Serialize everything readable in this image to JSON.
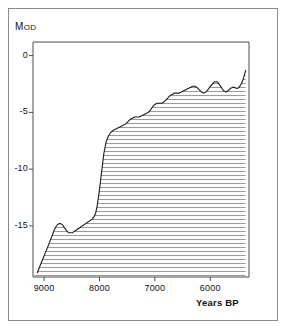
{
  "figure": {
    "background_color": "#ffffff",
    "frame_color": "#8a8a8a",
    "axis_color": "#4a4a4a",
    "curve_color": "#1a1a1a",
    "hatch_color": "#9a9a9a"
  },
  "chart_data": {
    "type": "area",
    "title": "",
    "subtitle": "",
    "xlabel": "Years BP",
    "ylabel": "M OD",
    "ylabel_main": "M",
    "ylabel_small": "OD",
    "xlim": [
      9200,
      5300
    ],
    "ylim": [
      -19.5,
      1.2
    ],
    "x_reversed": true,
    "grid": false,
    "legend": null,
    "annotations": [],
    "x_ticks": [
      9000,
      8000,
      7000,
      6000
    ],
    "x_tick_labels": [
      "9000",
      "8000",
      "7000",
      "6000"
    ],
    "y_ticks": [
      0,
      -5,
      -10,
      -15
    ],
    "y_tick_labels": [
      "0",
      "-5",
      "-10",
      "-15"
    ],
    "fill_style": "horizontal-hatch",
    "fill_direction": "below-curve-to-left-axis",
    "series": [
      {
        "name": "Relative sea level",
        "x": [
          9120,
          9080,
          9030,
          8980,
          8930,
          8890,
          8850,
          8820,
          8790,
          8760,
          8730,
          8700,
          8670,
          8640,
          8610,
          8580,
          8550,
          8520,
          8490,
          8460,
          8430,
          8400,
          8370,
          8340,
          8310,
          8280,
          8250,
          8220,
          8190,
          8160,
          8130,
          8100,
          8070,
          8040,
          8010,
          7980,
          7950,
          7920,
          7880,
          7840,
          7800,
          7760,
          7720,
          7680,
          7640,
          7600,
          7560,
          7520,
          7480,
          7440,
          7400,
          7360,
          7320,
          7280,
          7240,
          7200,
          7160,
          7120,
          7080,
          7040,
          7000,
          6960,
          6920,
          6880,
          6840,
          6800,
          6760,
          6720,
          6680,
          6640,
          6600,
          6560,
          6520,
          6480,
          6440,
          6400,
          6360,
          6320,
          6280,
          6240,
          6200,
          6160,
          6120,
          6080,
          6040,
          6000,
          5960,
          5920,
          5880,
          5840,
          5800,
          5760,
          5720,
          5680,
          5640,
          5600,
          5560,
          5520,
          5480,
          5440,
          5400,
          5360
        ],
        "y": [
          -19.1,
          -18.6,
          -18.0,
          -17.4,
          -16.8,
          -16.3,
          -15.8,
          -15.4,
          -15.1,
          -14.9,
          -14.8,
          -14.8,
          -14.9,
          -15.1,
          -15.3,
          -15.5,
          -15.6,
          -15.6,
          -15.6,
          -15.5,
          -15.4,
          -15.3,
          -15.2,
          -15.1,
          -15.0,
          -14.9,
          -14.8,
          -14.7,
          -14.6,
          -14.5,
          -14.4,
          -14.2,
          -13.9,
          -13.2,
          -12.2,
          -11.0,
          -9.8,
          -8.6,
          -7.6,
          -7.1,
          -6.8,
          -6.6,
          -6.5,
          -6.4,
          -6.3,
          -6.2,
          -6.1,
          -6.0,
          -5.8,
          -5.6,
          -5.5,
          -5.4,
          -5.4,
          -5.4,
          -5.3,
          -5.2,
          -5.1,
          -5.0,
          -4.8,
          -4.5,
          -4.3,
          -4.2,
          -4.2,
          -4.2,
          -4.1,
          -3.9,
          -3.7,
          -3.5,
          -3.4,
          -3.3,
          -3.3,
          -3.3,
          -3.2,
          -3.1,
          -3.0,
          -2.9,
          -2.8,
          -2.7,
          -2.7,
          -2.8,
          -3.0,
          -3.2,
          -3.3,
          -3.2,
          -3.0,
          -2.7,
          -2.5,
          -2.3,
          -2.3,
          -2.5,
          -2.8,
          -3.1,
          -3.2,
          -3.1,
          -2.9,
          -2.8,
          -2.8,
          -2.9,
          -2.8,
          -2.5,
          -2.0,
          -1.3
        ]
      }
    ]
  },
  "axis_titles": {
    "y": "M OD",
    "x": "Years BP"
  }
}
